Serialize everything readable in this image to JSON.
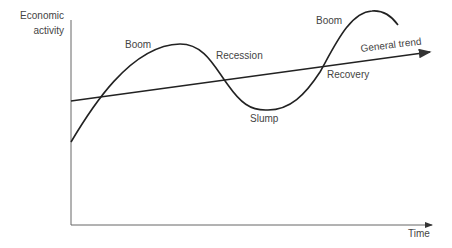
{
  "diagram": {
    "y_axis_label_line1": "Economic",
    "y_axis_label_line2": "activity",
    "x_axis_label": "Time",
    "labels": {
      "boom1": "Boom",
      "recession": "Recession",
      "slump": "Slump",
      "recovery": "Recovery",
      "boom2": "Boom",
      "trend": "General trend"
    },
    "colors": {
      "curve": "#222222",
      "axis": "#555555",
      "text": "#444444"
    }
  }
}
